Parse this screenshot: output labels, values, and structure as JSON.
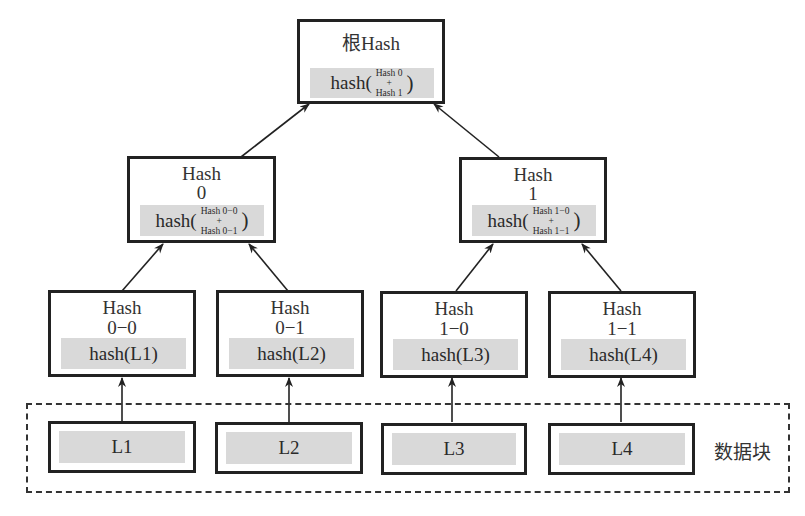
{
  "diagram": {
    "type": "merkle-tree",
    "root": {
      "title": "根Hash",
      "formula_prefix": "hash(",
      "formula_top": "Hash 0",
      "formula_plus": "+",
      "formula_bottom": "Hash 1",
      "formula_suffix": ")"
    },
    "level1": [
      {
        "title_line1": "Hash",
        "title_line2": "0",
        "formula_prefix": "hash(",
        "formula_top": "Hash 0−0",
        "formula_plus": "+",
        "formula_bottom": "Hash 0−1",
        "formula_suffix": ")"
      },
      {
        "title_line1": "Hash",
        "title_line2": "1",
        "formula_prefix": "hash(",
        "formula_top": "Hash 1−0",
        "formula_plus": "+",
        "formula_bottom": "Hash 1−1",
        "formula_suffix": ")"
      }
    ],
    "leaves": [
      {
        "title_line1": "Hash",
        "title_line2": "0−0",
        "formula": "hash(L1)"
      },
      {
        "title_line1": "Hash",
        "title_line2": "0−1",
        "formula": "hash(L2)"
      },
      {
        "title_line1": "Hash",
        "title_line2": "1−0",
        "formula": "hash(L3)"
      },
      {
        "title_line1": "Hash",
        "title_line2": "1−1",
        "formula": "hash(L4)"
      }
    ],
    "data_blocks": {
      "label": "数据块",
      "items": [
        "L1",
        "L2",
        "L3",
        "L4"
      ]
    },
    "colors": {
      "border": "#222222",
      "shade": "#d9d9d9",
      "background": "#ffffff"
    }
  }
}
